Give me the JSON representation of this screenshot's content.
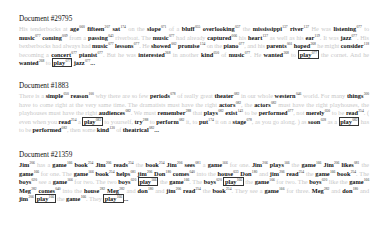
{
  "documents": [
    {
      "title": "Document #29795",
      "tokens": [
        {
          "t": "His tenderbocks at",
          "k": false
        },
        {
          "t": "age",
          "n": "060",
          "k": true
        },
        {
          "t": "fifteen",
          "n": "207",
          "k": true
        },
        {
          "t": "sat",
          "n": "174",
          "k": true
        },
        {
          "t": "on the",
          "k": false
        },
        {
          "t": "slope",
          "n": "071",
          "k": true
        },
        {
          "t": "of a",
          "k": false
        },
        {
          "t": "bluff",
          "n": "055",
          "k": true
        },
        {
          "t": "overlooking",
          "n": "037",
          "k": true
        },
        {
          "t": "the",
          "k": false
        },
        {
          "t": "mississippi",
          "n": "137",
          "k": true
        },
        {
          "t": "river",
          "n": "137",
          "k": true
        },
        {
          "t": "He was",
          "k": false
        },
        {
          "t": "listening",
          "n": "077",
          "k": true
        },
        {
          "t": "to",
          "k": false
        },
        {
          "t": "music",
          "n": "077",
          "k": true
        },
        {
          "t": "coming",
          "n": "009",
          "k": true
        },
        {
          "t": "from a",
          "k": false
        },
        {
          "t": "passing",
          "n": "043",
          "k": true
        },
        {
          "t": "riverboat. The",
          "k": false
        },
        {
          "t": "music",
          "n": "077",
          "k": true
        },
        {
          "t": "had already",
          "k": false
        },
        {
          "t": "captured",
          "n": "006",
          "k": true
        },
        {
          "t": "his",
          "k": false
        },
        {
          "t": "heart",
          "n": "137",
          "k": true
        },
        {
          "t": "as well as his",
          "k": false
        },
        {
          "t": "ear",
          "n": "119",
          "k": true
        },
        {
          "t": ". It was",
          "k": false
        },
        {
          "t": "jazz",
          "n": "077",
          "k": true
        },
        {
          "t": ". His bexberbocks had always had",
          "k": false
        },
        {
          "t": "music",
          "n": "077",
          "k": true
        },
        {
          "t": "lessons",
          "n": "077",
          "k": true
        },
        {
          "t": ". He",
          "k": false
        },
        {
          "t": "showed",
          "n": "002",
          "k": true
        },
        {
          "t": "promise",
          "n": "134",
          "k": true
        },
        {
          "t": "on the",
          "k": false
        },
        {
          "t": "piano",
          "n": "077",
          "k": true
        },
        {
          "t": ", and his",
          "k": false
        },
        {
          "t": "parents",
          "n": "001",
          "k": true
        },
        {
          "t": "hoped",
          "n": "268",
          "k": true
        },
        {
          "t": "he might",
          "k": false
        },
        {
          "t": "consider",
          "n": "118",
          "k": true
        },
        {
          "t": "becoming a",
          "k": false
        },
        {
          "t": "concert",
          "n": "077",
          "k": true
        },
        {
          "t": "pianist",
          "n": "077",
          "k": true
        },
        {
          "t": ". But he was",
          "k": false
        },
        {
          "t": "interested",
          "n": "268",
          "k": true
        },
        {
          "t": "in another",
          "k": false
        },
        {
          "t": "kind",
          "n": "050",
          "k": true
        },
        {
          "t": "of",
          "k": false
        },
        {
          "t": "music",
          "n": "077",
          "k": true
        },
        {
          "t": ". He",
          "k": false
        },
        {
          "t": "wanted",
          "n": "268",
          "k": true
        },
        {
          "t": "to",
          "k": false
        },
        {
          "t": "play",
          "n": "077",
          "k": true,
          "boxed": true
        },
        {
          "t": "the cornet. And he",
          "k": false
        },
        {
          "t": "wanted",
          "n": "268",
          "k": true
        },
        {
          "t": "to",
          "k": false
        },
        {
          "t": "play",
          "n": "077",
          "k": true,
          "boxed": true
        },
        {
          "t": "jazz",
          "n": "077",
          "k": true
        },
        {
          "t": "...",
          "k": false,
          "dark": true
        }
      ]
    },
    {
      "title": "Document #1883",
      "tokens": [
        {
          "t": "There is a",
          "k": false
        },
        {
          "t": "simple",
          "n": "050",
          "k": true
        },
        {
          "t": "reason",
          "n": "100",
          "k": true
        },
        {
          "t": "why there are so few",
          "k": false
        },
        {
          "t": "periods",
          "n": "078",
          "k": true
        },
        {
          "t": "of really great",
          "k": false
        },
        {
          "t": "theater",
          "n": "082",
          "k": true
        },
        {
          "t": "in our whole",
          "k": false
        },
        {
          "t": "western",
          "n": "046",
          "k": true
        },
        {
          "t": "world. For many",
          "k": false
        },
        {
          "t": "things",
          "n": "300",
          "k": true
        },
        {
          "t": "have to come right at the very same time. The dramatists must have the right",
          "k": false
        },
        {
          "t": "actors",
          "n": "082",
          "k": true
        },
        {
          "t": ", the",
          "k": false
        },
        {
          "t": "actors",
          "n": "082",
          "k": true
        },
        {
          "t": "must have the right playhouses, the playhouses must have the right",
          "k": false
        },
        {
          "t": "audiences",
          "n": "082",
          "k": true
        },
        {
          "t": ". We must",
          "k": false
        },
        {
          "t": "remember",
          "n": "288",
          "k": true
        },
        {
          "t": "that",
          "k": false
        },
        {
          "t": "plays",
          "n": "082",
          "k": true
        },
        {
          "t": "exist",
          "n": "143",
          "k": true
        },
        {
          "t": "to be",
          "k": false
        },
        {
          "t": "performed",
          "n": "077",
          "k": true
        },
        {
          "t": ", not",
          "k": false
        },
        {
          "t": "merely",
          "n": "050",
          "k": true
        },
        {
          "t": "to be",
          "k": false
        },
        {
          "t": "read",
          "n": "254",
          "k": true
        },
        {
          "t": ". ( even when you",
          "k": false
        },
        {
          "t": "read",
          "n": "254",
          "k": true
        },
        {
          "t": "a",
          "k": false
        },
        {
          "t": "play",
          "n": "082",
          "k": true,
          "boxed": true
        },
        {
          "t": "to yourself,",
          "k": false
        },
        {
          "t": "try",
          "n": "288",
          "k": true
        },
        {
          "t": "to",
          "k": false
        },
        {
          "t": "perform",
          "n": "082",
          "k": true
        },
        {
          "t": "it, to",
          "k": false
        },
        {
          "t": "put",
          "n": "174",
          "k": true
        },
        {
          "t": "it on a",
          "k": false
        },
        {
          "t": "stage",
          "n": "078",
          "k": true
        },
        {
          "t": ", as you go along. ) as",
          "k": false
        },
        {
          "t": "soon",
          "n": "028",
          "k": true
        },
        {
          "t": "as a",
          "k": false
        },
        {
          "t": "play",
          "n": "082",
          "k": true,
          "boxed": true
        },
        {
          "t": "has to be",
          "k": false
        },
        {
          "t": "performed",
          "n": "082",
          "k": true
        },
        {
          "t": ", then some",
          "k": false
        },
        {
          "t": "kind",
          "n": "130",
          "k": true
        },
        {
          "t": "of",
          "k": false
        },
        {
          "t": "theatrical",
          "n": "082",
          "k": true
        },
        {
          "t": "...",
          "k": false,
          "dark": true
        }
      ]
    },
    {
      "title": "Document #21359",
      "tokens": [
        {
          "t": "Jim",
          "n": "206",
          "k": true
        },
        {
          "t": "has a",
          "k": false
        },
        {
          "t": "game",
          "n": "166",
          "k": true
        },
        {
          "t": "book",
          "n": "254",
          "k": true
        },
        {
          "t": "Jim",
          "n": "206",
          "k": true
        },
        {
          "t": "reads",
          "n": "254",
          "k": true
        },
        {
          "t": "the",
          "k": false
        },
        {
          "t": "book",
          "n": "254",
          "k": true
        },
        {
          "t": "Jim",
          "n": "206",
          "k": true
        },
        {
          "t": "sees",
          "n": "081",
          "k": true
        },
        {
          "t": "a",
          "k": false
        },
        {
          "t": "game",
          "n": "166",
          "k": true
        },
        {
          "t": "for one.",
          "k": false
        },
        {
          "t": "Jim",
          "n": "206",
          "k": true
        },
        {
          "t": "plays",
          "n": "166",
          "k": true
        },
        {
          "t": "the",
          "k": false
        },
        {
          "t": "game",
          "n": "166",
          "k": true
        },
        {
          "t": "Jim",
          "n": "206",
          "k": true
        },
        {
          "t": "likes",
          "n": "081",
          "k": true
        },
        {
          "t": "the",
          "k": false
        },
        {
          "t": "game",
          "n": "166",
          "k": true
        },
        {
          "t": "for one. The",
          "k": false
        },
        {
          "t": "game",
          "n": "166",
          "k": true
        },
        {
          "t": "book",
          "n": "254",
          "k": true
        },
        {
          "t": "helps",
          "n": "081",
          "k": true
        },
        {
          "t": "jim",
          "n": "206",
          "k": true
        },
        {
          "t": "Don",
          "n": "180",
          "k": true
        },
        {
          "t": "comes",
          "n": "040",
          "k": true
        },
        {
          "t": "into the",
          "k": false
        },
        {
          "t": "house",
          "n": "033",
          "k": true
        },
        {
          "t": "Don",
          "n": "180",
          "k": true
        },
        {
          "t": "and",
          "k": false
        },
        {
          "t": "jim",
          "n": "206",
          "k": true
        },
        {
          "t": "read",
          "n": "254",
          "k": true
        },
        {
          "t": "the",
          "k": false
        },
        {
          "t": "game",
          "n": "166",
          "k": true
        },
        {
          "t": "book",
          "n": "254",
          "k": true
        },
        {
          "t": ". The",
          "k": false
        },
        {
          "t": "boys",
          "n": "020",
          "k": true
        },
        {
          "t": "see a",
          "k": false
        },
        {
          "t": "game",
          "n": "166",
          "k": true
        },
        {
          "t": "for two. The two",
          "k": false
        },
        {
          "t": "boys",
          "n": "020",
          "k": true
        },
        {
          "t": "play",
          "n": "166",
          "k": true,
          "boxed": true
        },
        {
          "t": "the",
          "k": false
        },
        {
          "t": "game",
          "n": "166",
          "k": true
        },
        {
          "t": ". The",
          "k": false
        },
        {
          "t": "boys",
          "n": "020",
          "k": true
        },
        {
          "t": "play",
          "n": "166",
          "k": true,
          "boxed": true
        },
        {
          "t": "the",
          "k": false
        },
        {
          "t": "game",
          "n": "166",
          "k": true
        },
        {
          "t": "for two. The",
          "k": false
        },
        {
          "t": "boys",
          "n": "020",
          "k": true
        },
        {
          "t": "like the",
          "k": false
        },
        {
          "t": "game",
          "n": "166",
          "k": true
        },
        {
          "t": "Meg",
          "n": "282",
          "k": true
        },
        {
          "t": "comes",
          "n": "040",
          "k": true
        },
        {
          "t": "into the",
          "k": false
        },
        {
          "t": "house",
          "n": "282",
          "k": true
        },
        {
          "t": "Meg",
          "n": "282",
          "k": true
        },
        {
          "t": "and",
          "k": false
        },
        {
          "t": "don",
          "n": "180",
          "k": true
        },
        {
          "t": "and",
          "k": false
        },
        {
          "t": "jim",
          "n": "206",
          "k": true
        },
        {
          "t": "read",
          "n": "254",
          "k": true
        },
        {
          "t": "the",
          "k": false
        },
        {
          "t": "book",
          "n": "254",
          "k": true
        },
        {
          "t": ". They see a",
          "k": false
        },
        {
          "t": "game",
          "n": "166",
          "k": true
        },
        {
          "t": "for three.",
          "k": false
        },
        {
          "t": "Meg",
          "n": "282",
          "k": true
        },
        {
          "t": "and",
          "k": false
        },
        {
          "t": "don",
          "n": "180",
          "k": true
        },
        {
          "t": "and",
          "k": false
        },
        {
          "t": "jim",
          "n": "206",
          "k": true
        },
        {
          "t": "play",
          "n": "166",
          "k": true,
          "boxed": true
        },
        {
          "t": "the",
          "k": false
        },
        {
          "t": "game",
          "n": "166",
          "k": true
        },
        {
          "t": ". They",
          "k": false
        },
        {
          "t": "play",
          "n": "166",
          "k": true,
          "boxed": true
        },
        {
          "t": "...",
          "k": false,
          "dark": true
        }
      ]
    }
  ]
}
